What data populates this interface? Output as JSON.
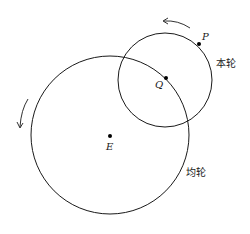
{
  "diagram": {
    "type": "epicycle-deferent",
    "points": {
      "P": {
        "label": "P"
      },
      "Q": {
        "label": "Q"
      },
      "E": {
        "label": "E"
      }
    },
    "circles": {
      "epicycle": {
        "label": "本轮",
        "center": "Q"
      },
      "deferent": {
        "label": "均轮",
        "center": "E"
      }
    },
    "arrows": [
      {
        "name": "epicycle-rotation",
        "direction": "counterclockwise"
      },
      {
        "name": "deferent-rotation",
        "direction": "counterclockwise"
      }
    ],
    "colors": {
      "stroke": "#1a1a1a",
      "background": "#ffffff"
    }
  }
}
